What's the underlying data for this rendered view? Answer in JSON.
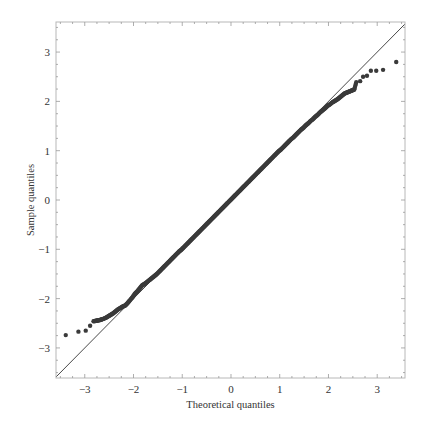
{
  "chart_data": {
    "type": "scatter",
    "title": "",
    "xlabel": "Theoretical quantiles",
    "ylabel": "Sample quantiles",
    "xlim": [
      -3.59,
      3.57
    ],
    "ylim": [
      -3.61,
      3.61
    ],
    "xticks": [
      -3,
      -2,
      -1,
      0,
      1,
      2,
      3
    ],
    "yticks": [
      -3,
      -2,
      -1,
      0,
      1,
      2,
      3
    ],
    "xtick_labels": [
      "−3",
      "−2",
      "−1",
      "0",
      "1",
      "2",
      "3"
    ],
    "ytick_labels": [
      "−3",
      "−2",
      "−1",
      "0",
      "1",
      "2",
      "3"
    ],
    "grid": false,
    "legend": null,
    "reference_line": {
      "slope": 1,
      "intercept": 0,
      "color": "#333333"
    },
    "series": [
      {
        "name": "Sample vs theoretical quantiles",
        "color": "#3a3a3a",
        "points": [
          [
            -3.39,
            -2.74
          ],
          [
            -3.13,
            -2.67
          ],
          [
            -2.98,
            -2.65
          ],
          [
            -2.89,
            -2.55
          ],
          [
            -2.82,
            -2.46
          ],
          [
            -2.77,
            -2.45
          ],
          [
            -2.72,
            -2.44
          ],
          [
            -2.67,
            -2.43
          ],
          [
            -2.62,
            -2.41
          ],
          [
            -2.57,
            -2.39
          ],
          [
            -2.52,
            -2.36
          ],
          [
            -2.47,
            -2.33
          ],
          [
            -2.42,
            -2.3
          ],
          [
            -2.37,
            -2.26
          ],
          [
            -2.32,
            -2.22
          ],
          [
            -2.27,
            -2.19
          ],
          [
            -2.22,
            -2.16
          ],
          [
            -2.17,
            -2.14
          ],
          [
            -2.12,
            -2.09
          ],
          [
            -2.07,
            -2.03
          ],
          [
            -2.02,
            -1.97
          ],
          [
            -1.97,
            -1.9
          ],
          [
            -1.92,
            -1.85
          ],
          [
            -1.87,
            -1.79
          ],
          [
            -1.82,
            -1.73
          ],
          [
            -1.77,
            -1.7
          ],
          [
            -1.72,
            -1.66
          ],
          [
            -1.67,
            -1.62
          ],
          [
            -1.62,
            -1.58
          ],
          [
            -1.57,
            -1.54
          ],
          [
            -1.52,
            -1.5
          ],
          [
            -1.47,
            -1.45
          ],
          [
            -1.42,
            -1.4
          ],
          [
            -1.37,
            -1.35
          ],
          [
            -1.32,
            -1.3
          ],
          [
            -1.27,
            -1.25
          ],
          [
            -1.22,
            -1.2
          ],
          [
            -1.17,
            -1.15
          ],
          [
            -1.12,
            -1.1
          ],
          [
            -1.07,
            -1.05
          ],
          [
            -1.02,
            -1.01
          ],
          [
            -0.97,
            -0.96
          ],
          [
            -0.92,
            -0.91
          ],
          [
            -0.87,
            -0.86
          ],
          [
            -0.82,
            -0.81
          ],
          [
            -0.77,
            -0.76
          ],
          [
            -0.72,
            -0.71
          ],
          [
            -0.67,
            -0.66
          ],
          [
            -0.62,
            -0.61
          ],
          [
            -0.57,
            -0.56
          ],
          [
            -0.52,
            -0.51
          ],
          [
            -0.47,
            -0.46
          ],
          [
            -0.42,
            -0.41
          ],
          [
            -0.37,
            -0.36
          ],
          [
            -0.32,
            -0.31
          ],
          [
            -0.27,
            -0.26
          ],
          [
            -0.22,
            -0.21
          ],
          [
            -0.17,
            -0.16
          ],
          [
            -0.12,
            -0.11
          ],
          [
            -0.07,
            -0.06
          ],
          [
            -0.02,
            -0.01
          ],
          [
            0.03,
            0.04
          ],
          [
            0.08,
            0.09
          ],
          [
            0.13,
            0.14
          ],
          [
            0.18,
            0.19
          ],
          [
            0.23,
            0.24
          ],
          [
            0.28,
            0.29
          ],
          [
            0.33,
            0.34
          ],
          [
            0.38,
            0.39
          ],
          [
            0.43,
            0.44
          ],
          [
            0.48,
            0.49
          ],
          [
            0.53,
            0.54
          ],
          [
            0.58,
            0.59
          ],
          [
            0.63,
            0.64
          ],
          [
            0.68,
            0.69
          ],
          [
            0.73,
            0.74
          ],
          [
            0.78,
            0.79
          ],
          [
            0.83,
            0.84
          ],
          [
            0.88,
            0.89
          ],
          [
            0.93,
            0.94
          ],
          [
            0.98,
            0.99
          ],
          [
            1.03,
            1.03
          ],
          [
            1.08,
            1.08
          ],
          [
            1.13,
            1.13
          ],
          [
            1.18,
            1.18
          ],
          [
            1.23,
            1.23
          ],
          [
            1.28,
            1.27
          ],
          [
            1.33,
            1.32
          ],
          [
            1.38,
            1.37
          ],
          [
            1.43,
            1.42
          ],
          [
            1.48,
            1.46
          ],
          [
            1.53,
            1.51
          ],
          [
            1.58,
            1.55
          ],
          [
            1.63,
            1.6
          ],
          [
            1.68,
            1.64
          ],
          [
            1.73,
            1.69
          ],
          [
            1.78,
            1.73
          ],
          [
            1.83,
            1.78
          ],
          [
            1.88,
            1.82
          ],
          [
            1.93,
            1.86
          ],
          [
            1.98,
            1.91
          ],
          [
            2.03,
            1.94
          ],
          [
            2.08,
            1.98
          ],
          [
            2.13,
            2.01
          ],
          [
            2.18,
            2.04
          ],
          [
            2.23,
            2.08
          ],
          [
            2.28,
            2.12
          ],
          [
            2.33,
            2.16
          ],
          [
            2.38,
            2.18
          ],
          [
            2.43,
            2.2
          ],
          [
            2.48,
            2.22
          ],
          [
            2.53,
            2.24
          ],
          [
            2.57,
            2.39
          ],
          [
            2.65,
            2.41
          ],
          [
            2.71,
            2.5
          ],
          [
            2.79,
            2.52
          ],
          [
            2.87,
            2.62
          ],
          [
            2.98,
            2.62
          ],
          [
            3.12,
            2.64
          ],
          [
            3.39,
            2.8
          ]
        ]
      }
    ]
  }
}
